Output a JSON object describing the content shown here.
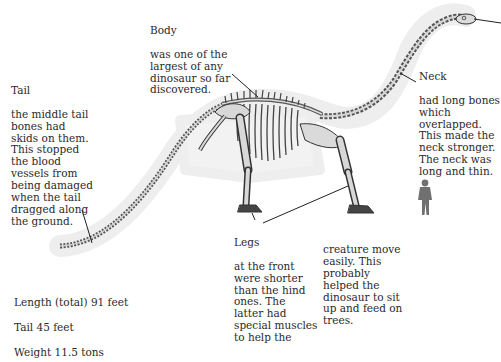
{
  "diagram": {
    "annotations": {
      "body": {
        "title": "Body",
        "text": "was one of the\nlargest of any\ndinosaur so far\ndiscovered."
      },
      "tail": {
        "title": "Tail",
        "text": "the middle tail\nbones had\nskids on them.\nThis stopped\nthe blood\nvessels from\nbeing damaged\nwhen the tail\ndragged along\nthe ground."
      },
      "neck": {
        "title": "Neck",
        "text": "had long bones\nwhich\noverlapped.\nThis made the\nneck stronger.\nThe neck was\nlong and thin."
      },
      "legs": {
        "title": "Legs",
        "text": "at the front\nwere shorter\nthan the hind\nones. The\nlatter had\nspecial muscles\nto help the"
      },
      "legs_continued": {
        "text": "creature move\neasily. This\nprobably\nhelped the\ndinosaur to sit\nup and feed on\ntrees."
      }
    },
    "stats": {
      "length": "Length (total) 91 feet",
      "tail": "Tail 45 feet",
      "weight": "Weight 11.5 tons"
    },
    "scale_figure": "human-silhouette",
    "colors": {
      "bone": "#d9d9d9",
      "bone_outline": "#3a3a3a",
      "halo": "#eeeeee",
      "human": "#707070",
      "leader_line": "#222222"
    }
  }
}
